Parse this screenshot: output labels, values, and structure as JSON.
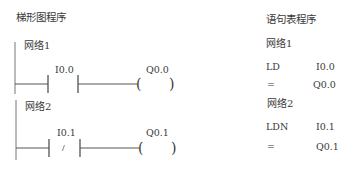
{
  "ladder": {
    "title": "梯形图程序",
    "networks": [
      {
        "label": "网络1",
        "contact": {
          "address": "I0.0",
          "type": "normally-open",
          "symbol": ""
        },
        "coil": {
          "address": "Q0.0",
          "symbol_left": "(",
          "symbol_right": ")"
        }
      },
      {
        "label": "网络2",
        "contact": {
          "address": "I0.1",
          "type": "normally-closed",
          "symbol": "/"
        },
        "coil": {
          "address": "Q0.1",
          "symbol_left": "(",
          "symbol_right": ")"
        }
      }
    ]
  },
  "statement_list": {
    "title": "语句表程序",
    "networks": [
      {
        "label": "网络1",
        "lines": [
          {
            "op": "LD",
            "operand": "I0.0"
          },
          {
            "op": "=",
            "operand": "Q0.0"
          }
        ]
      },
      {
        "label": "网络2",
        "lines": [
          {
            "op": "LDN",
            "operand": "I0.1"
          },
          {
            "op": "=",
            "operand": "Q0.1"
          }
        ]
      }
    ]
  },
  "colors": {
    "line": "#555555",
    "text": "#3a3a3a",
    "background": "#ffffff"
  }
}
